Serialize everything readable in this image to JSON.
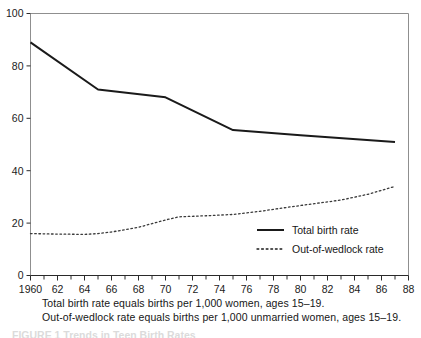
{
  "figure": {
    "caption_lines": [
      "Total birth rate equals births per 1,000 women, ages 15–19.",
      "Out-of-wedlock rate equals births per 1,000 unmarried women, ages 15–19."
    ],
    "figure_number_partial": "FIGURE 1   Trends in Teen Birth Rates"
  },
  "chart_data": {
    "type": "line",
    "title": "",
    "xlabel": "",
    "ylabel": "",
    "xlim": [
      1960,
      1988
    ],
    "ylim": [
      0,
      100
    ],
    "grid": false,
    "legend_position": "inside-right",
    "x_ticks_major": [
      1960,
      1962,
      1964,
      1966,
      1968,
      1970,
      1972,
      1974,
      1976,
      1978,
      1980,
      1982,
      1984,
      1986,
      1988
    ],
    "x_tick_labels": [
      "1960",
      "62",
      "64",
      "66",
      "68",
      "70",
      "72",
      "74",
      "76",
      "78",
      "80",
      "82",
      "84",
      "86",
      "88"
    ],
    "x_ticks_minor_every": 1,
    "y_ticks": [
      0,
      20,
      40,
      60,
      80,
      100
    ],
    "y_tick_labels": [
      "0",
      "20",
      "40",
      "60",
      "80",
      "100"
    ],
    "series": [
      {
        "name": "Total birth rate",
        "style": "solid",
        "color": "#1a1a1a",
        "width": 2.0,
        "x": [
          1960,
          1965,
          1970,
          1975,
          1980,
          1987
        ],
        "values": [
          89,
          71,
          68,
          55.5,
          53.5,
          51
        ]
      },
      {
        "name": "Out-of-wedlock rate",
        "style": "dotted",
        "color": "#3a3a3a",
        "width": 1.3,
        "x": [
          1960,
          1962,
          1964,
          1965,
          1966,
          1968,
          1970,
          1971,
          1973,
          1975,
          1977,
          1979,
          1981,
          1983,
          1985,
          1987
        ],
        "values": [
          16,
          15.8,
          15.7,
          16,
          16.6,
          18.4,
          21.2,
          22.4,
          22.8,
          23.3,
          24.5,
          26.0,
          27.4,
          28.8,
          31.0,
          34.0
        ]
      }
    ]
  },
  "legend": {
    "entries": [
      {
        "label": "Total birth rate",
        "style": "solid"
      },
      {
        "label": "Out-of-wedlock rate",
        "style": "dotted"
      }
    ]
  }
}
